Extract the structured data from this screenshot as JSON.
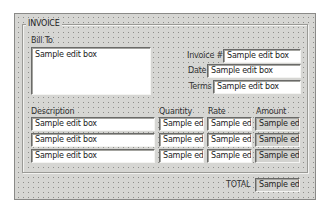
{
  "form": {
    "group_title": "INVOICE",
    "bill_to": {
      "label": "Bill To",
      "value": "Sample edit box"
    },
    "invoice_number": {
      "label": "Invoice #",
      "value": "Sample edit box"
    },
    "date": {
      "label": "Date",
      "value": "Sample edit box"
    },
    "terms": {
      "label": "Terms",
      "value": "Sample edit box"
    },
    "line_items": {
      "headers": {
        "description": "Description",
        "quantity": "Quantity",
        "rate": "Rate",
        "amount": "Amount"
      },
      "rows": [
        {
          "description": "Sample edit box",
          "quantity": "Sample edit",
          "rate": "Sample edit",
          "amount": "Sample edit"
        },
        {
          "description": "Sample edit box",
          "quantity": "Sample edit",
          "rate": "Sample edit",
          "amount": "Sample edit"
        },
        {
          "description": "Sample edit box",
          "quantity": "Sample edit",
          "rate": "Sample edit",
          "amount": "Sample edit"
        }
      ]
    },
    "total": {
      "label": "TOTAL",
      "value": "Sample edit"
    }
  }
}
